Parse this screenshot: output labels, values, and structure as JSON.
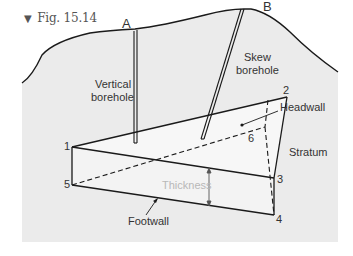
{
  "figure": {
    "caption_marker": "▼",
    "caption": "Fig. 15.14"
  },
  "labels": {
    "borehole_a": "A",
    "borehole_b": "B",
    "vertical_borehole_line1": "Vertical",
    "vertical_borehole_line2": "borehole",
    "skew_borehole_line1": "Skew",
    "skew_borehole_line2": "borehole",
    "headwall": "Headwall",
    "stratum": "Stratum",
    "thickness": "Thickness",
    "footwall": "Footwall"
  },
  "vertices": {
    "v1": "1",
    "v2": "2",
    "v3": "3",
    "v4": "4",
    "v5": "5",
    "v6": "6"
  },
  "colors": {
    "stratum_fill": "#ebebeb",
    "prism_fill": "#f4f4f4",
    "line": "#1a1a1a",
    "thickness_text": "#b8b8b8"
  }
}
